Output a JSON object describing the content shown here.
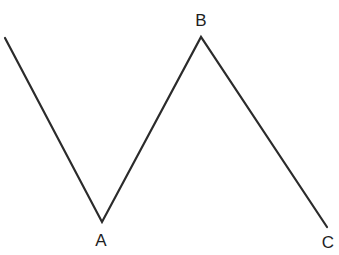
{
  "figure": {
    "background_color": "#ffffff",
    "stroke_color": "#2b2b2b",
    "stroke_width": 2.2,
    "label_color": "#1e1e1e",
    "label_font_size": 17,
    "width": 339,
    "height": 255
  },
  "chart_data": {
    "type": "line",
    "title": "",
    "xlabel": "",
    "ylabel": "",
    "grid": false,
    "legend": null,
    "axes_visible": false,
    "xlim": [
      0,
      339
    ],
    "ylim": [
      255,
      0
    ],
    "series": [
      {
        "name": "zigzag-path",
        "color": "#2b2b2b",
        "points": [
          {
            "label": "",
            "x": 5,
            "y": 38
          },
          {
            "label": "A",
            "x": 102,
            "y": 222
          },
          {
            "label": "B",
            "x": 201,
            "y": 37
          },
          {
            "label": "C",
            "x": 327,
            "y": 227
          }
        ]
      }
    ],
    "annotations": [
      {
        "text": "A",
        "x": 101,
        "y": 240,
        "anchor": "middle"
      },
      {
        "text": "B",
        "x": 201,
        "y": 20,
        "anchor": "middle"
      },
      {
        "text": "C",
        "x": 328,
        "y": 242,
        "anchor": "middle"
      }
    ]
  },
  "labels": {
    "a": "A",
    "b": "B",
    "c": "C"
  }
}
